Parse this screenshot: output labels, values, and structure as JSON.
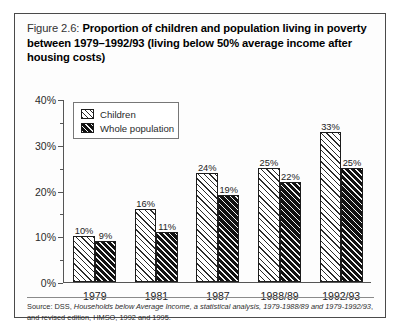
{
  "figure": {
    "number": "Figure 2.6:",
    "title": "Proportion of children and population living in poverty between 1979–1992/93 (living below 50% average income after housing costs)",
    "source_line1_a": "Source: DSS, ",
    "source_line1_b": "Households below Average Income, a statistical analysis, 1979-1988/89 and 1979-1992/93",
    "source_line1_c": ", and revised",
    "source_line2": "edition, HMSO, 1992 and 1995."
  },
  "legend": {
    "items": [
      {
        "label": "Children",
        "key": "children"
      },
      {
        "label": "Whole population",
        "key": "whole"
      }
    ]
  },
  "chart_data": {
    "type": "bar",
    "title": "Proportion of children and population living in poverty between 1979–1992/93 (living below 50% average income after housing costs)",
    "xlabel": "",
    "ylabel": "",
    "categories": [
      "1979",
      "1981",
      "1987",
      "1988/89",
      "1992/93"
    ],
    "series": [
      {
        "name": "Children",
        "values": [
          10,
          16,
          24,
          25,
          33
        ],
        "labels": [
          "10%",
          "16%",
          "24%",
          "25%",
          "33%"
        ],
        "fill": "light-diagonal-hatch"
      },
      {
        "name": "Whole population",
        "values": [
          9,
          11,
          19,
          22,
          25
        ],
        "labels": [
          "9%",
          "11%",
          "19%",
          "22%",
          "25%"
        ],
        "fill": "dark-diagonal-hatch"
      }
    ],
    "ylim": [
      0,
      40
    ],
    "ytick_labels": [
      "0%",
      "10%",
      "20%",
      "30%",
      "40%"
    ],
    "ytick_values": [
      0,
      10,
      20,
      30,
      40
    ],
    "yminor_values": [
      5,
      15,
      25,
      35
    ],
    "grid": false,
    "legend_position": "upper-left-inside"
  },
  "colors": {
    "frame": "#4a4a4a",
    "axis": "#555555",
    "bar_dark": "#111111",
    "bar_light": "#ffffff",
    "text": "#1a1a1a"
  }
}
